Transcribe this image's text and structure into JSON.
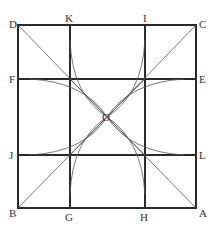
{
  "diagram": {
    "colors": {
      "line": "#2a2a2a",
      "thin": "#555555",
      "label": "#333333"
    },
    "square": {
      "x1": 18,
      "y1": 25,
      "x2": 196,
      "y2": 208
    },
    "grid": {
      "vx": [
        70,
        145
      ],
      "hy": [
        79,
        155
      ]
    },
    "center": {
      "label": "O",
      "x": 107,
      "y": 117
    },
    "labels": [
      {
        "id": "D",
        "text": "D",
        "x": 9,
        "y": 19
      },
      {
        "id": "K",
        "text": "K",
        "x": 65,
        "y": 13
      },
      {
        "id": "I",
        "text": "I",
        "x": 143,
        "y": 13
      },
      {
        "id": "C",
        "text": "C",
        "x": 199,
        "y": 19
      },
      {
        "id": "F",
        "text": "F",
        "x": 9,
        "y": 74
      },
      {
        "id": "E",
        "text": "E",
        "x": 199,
        "y": 74
      },
      {
        "id": "O",
        "text": "O",
        "x": 102,
        "y": 112
      },
      {
        "id": "J",
        "text": "J",
        "x": 9,
        "y": 150
      },
      {
        "id": "L",
        "text": "L",
        "x": 199,
        "y": 150
      },
      {
        "id": "B",
        "text": "B",
        "x": 9,
        "y": 208
      },
      {
        "id": "G",
        "text": "G",
        "x": 65,
        "y": 212
      },
      {
        "id": "H",
        "text": "H",
        "x": 140,
        "y": 212
      },
      {
        "id": "A",
        "text": "A",
        "x": 199,
        "y": 208
      }
    ]
  }
}
